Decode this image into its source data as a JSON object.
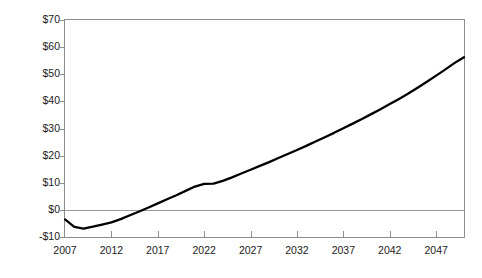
{
  "chart_data": {
    "type": "line",
    "title": "",
    "subtitle": "",
    "xlabel": "",
    "ylabel": "Billions of 2006 dollars",
    "xlim": [
      2007,
      2050
    ],
    "ylim": [
      -10,
      70
    ],
    "grid": false,
    "legend": null,
    "x_tick_labels": [
      "2007",
      "2012",
      "2017",
      "2022",
      "2027",
      "2032",
      "2037",
      "2042",
      "2047"
    ],
    "x_ticks": [
      2007,
      2012,
      2017,
      2022,
      2027,
      2032,
      2037,
      2042,
      2047
    ],
    "y_tick_labels": [
      "-$10",
      "$0",
      "$10",
      "$20",
      "$30",
      "$40",
      "$50",
      "$60",
      "$70"
    ],
    "y_ticks": [
      -10,
      0,
      10,
      20,
      30,
      40,
      50,
      60,
      70
    ],
    "line_color": "#000000",
    "axis_color": "#8d8d8d",
    "zero_line_color": "#9a9a9a",
    "series": [
      {
        "name": "Net value",
        "x": [
          2007,
          2008,
          2009,
          2010,
          2011,
          2012,
          2013,
          2014,
          2015,
          2016,
          2017,
          2018,
          2019,
          2020,
          2021,
          2022,
          2023,
          2024,
          2025,
          2026,
          2027,
          2028,
          2029,
          2030,
          2031,
          2032,
          2033,
          2034,
          2035,
          2036,
          2037,
          2038,
          2039,
          2040,
          2041,
          2042,
          2043,
          2044,
          2045,
          2046,
          2047,
          2048,
          2049,
          2050
        ],
        "values": [
          -3.5,
          -6.3,
          -6.9,
          -6.2,
          -5.4,
          -4.6,
          -3.4,
          -2.0,
          -0.6,
          0.9,
          2.4,
          3.9,
          5.4,
          7.0,
          8.6,
          9.6,
          9.7,
          10.7,
          12.0,
          13.4,
          14.8,
          16.2,
          17.6,
          19.1,
          20.6,
          22.1,
          23.6,
          25.2,
          26.8,
          28.4,
          30.1,
          31.8,
          33.5,
          35.3,
          37.1,
          39.0,
          40.9,
          42.9,
          45.0,
          47.2,
          49.5,
          51.8,
          54.2,
          56.3
        ]
      }
    ]
  }
}
